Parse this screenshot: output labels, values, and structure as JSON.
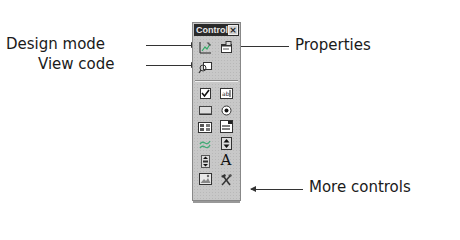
{
  "toolbar": {
    "title": "Control",
    "close_glyph": "×"
  },
  "callouts": {
    "design_mode": "Design mode",
    "view_code": "View code",
    "properties": "Properties",
    "more_controls": "More controls"
  },
  "buttons": [
    {
      "id": "design-mode",
      "icon": "design-mode-icon"
    },
    {
      "id": "properties",
      "icon": "properties-icon"
    },
    {
      "id": "view-code",
      "icon": "view-code-icon"
    },
    {
      "id": "check-box",
      "icon": "check-box-icon"
    },
    {
      "id": "text-box",
      "icon": "text-box-icon",
      "label": "ab|"
    },
    {
      "id": "command-button",
      "icon": "command-button-icon"
    },
    {
      "id": "option-button",
      "icon": "option-button-icon"
    },
    {
      "id": "list-box",
      "icon": "list-box-icon"
    },
    {
      "id": "combo-box",
      "icon": "combo-box-icon"
    },
    {
      "id": "toggle-button",
      "icon": "toggle-button-icon"
    },
    {
      "id": "spin-button",
      "icon": "spin-button-icon"
    },
    {
      "id": "scroll-bar",
      "icon": "scroll-bar-icon"
    },
    {
      "id": "label",
      "icon": "label-icon",
      "label": "A"
    },
    {
      "id": "image",
      "icon": "image-icon"
    },
    {
      "id": "more-controls",
      "icon": "more-controls-icon"
    }
  ],
  "colors": {
    "titlebar": "#2a2a2a",
    "panel": "#c8c8c8",
    "text": "#1a1a1a"
  }
}
